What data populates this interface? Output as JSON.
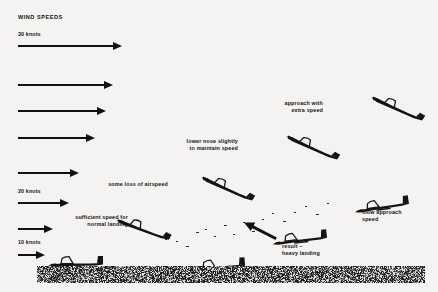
{
  "diagram": {
    "title": "WIND SPEEDS",
    "background_color": "#f4f3f1",
    "ink_color": "#111111",
    "ground_color": "#9a9a96"
  },
  "wind_scale": {
    "labels": [
      {
        "text": "30 knots",
        "x": 18,
        "y": 31
      },
      {
        "text": "20 knots",
        "x": 18,
        "y": 188
      },
      {
        "text": "10 knots",
        "x": 18,
        "y": 239
      }
    ],
    "arrows": [
      {
        "name": "wind-arrow-30-knots",
        "x": 18,
        "y": 45,
        "length": 95,
        "speed_knots": 30
      },
      {
        "name": "wind-arrow-2",
        "x": 18,
        "y": 84,
        "length": 86,
        "speed_knots": 27
      },
      {
        "name": "wind-arrow-3",
        "x": 18,
        "y": 110,
        "length": 79,
        "speed_knots": 25
      },
      {
        "name": "wind-arrow-4",
        "x": 18,
        "y": 137,
        "length": 68,
        "speed_knots": 23
      },
      {
        "name": "wind-arrow-5",
        "x": 18,
        "y": 172,
        "length": 52,
        "speed_knots": 21
      },
      {
        "name": "wind-arrow-20-knots",
        "x": 18,
        "y": 202,
        "length": 42,
        "speed_knots": 20
      },
      {
        "name": "wind-arrow-7",
        "x": 18,
        "y": 228,
        "length": 26,
        "speed_knots": 14
      },
      {
        "name": "wind-arrow-10-knots",
        "x": 18,
        "y": 254,
        "length": 18,
        "speed_knots": 10
      }
    ]
  },
  "annotations": [
    {
      "name": "annotation-approach-with-extra-speed",
      "line1": "approach with",
      "line2": "extra speed",
      "x": 323,
      "y": 100,
      "align": "right"
    },
    {
      "name": "annotation-lower-nose-slightly",
      "line1": "lower nose slightly",
      "line2": "to maintain speed",
      "x": 238,
      "y": 138,
      "align": "right"
    },
    {
      "name": "annotation-some-loss-of-airspeed",
      "line1": "some loss of airspeed",
      "line2": "",
      "x": 168,
      "y": 181,
      "align": "right"
    },
    {
      "name": "annotation-sufficient-speed-for-normal-landing",
      "line1": "sufficient speed for",
      "line2": "normal landing",
      "x": 128,
      "y": 214,
      "align": "right"
    },
    {
      "name": "annotation-slow-approach-speed",
      "line1": "slow approach",
      "line2": "speed",
      "x": 362,
      "y": 209,
      "align": "left"
    },
    {
      "name": "annotation-result-heavy-landing",
      "line1": "result –",
      "line2": "heavy landing",
      "x": 282,
      "y": 243,
      "align": "left"
    }
  ],
  "gliders": [
    {
      "name": "glider-approach-extra-speed",
      "x": 366,
      "y": 98,
      "scale": 1.0,
      "rotation": 34,
      "state": "nose-down-fast"
    },
    {
      "name": "glider-lower-nose",
      "x": 281,
      "y": 137,
      "scale": 1.0,
      "rotation": 34,
      "state": "nose-down-fast"
    },
    {
      "name": "glider-some-loss-airspeed",
      "x": 196,
      "y": 178,
      "scale": 1.0,
      "rotation": 34,
      "state": "nose-down-fast"
    },
    {
      "name": "glider-sufficient-speed",
      "x": 112,
      "y": 219,
      "scale": 1.0,
      "rotation": 30,
      "state": "nose-down-fast"
    },
    {
      "name": "glider-landed-normal",
      "x": 46,
      "y": 253,
      "scale": 1.0,
      "rotation": 0,
      "state": "level-landed"
    },
    {
      "name": "glider-slow-approach",
      "x": 352,
      "y": 196,
      "scale": 1.0,
      "rotation": -8,
      "state": "level-slow"
    },
    {
      "name": "glider-slow-descending",
      "x": 270,
      "y": 229,
      "scale": 1.0,
      "rotation": -6,
      "state": "level-slow"
    },
    {
      "name": "glider-heavy-landing",
      "x": 188,
      "y": 256,
      "scale": 1.0,
      "rotation": -4,
      "state": "heavy-landing"
    }
  ],
  "ground": {
    "x": 37,
    "y": 266,
    "width": 388,
    "height": 17
  },
  "descent_trail_dots": [
    {
      "x": 196,
      "y": 232
    },
    {
      "x": 205,
      "y": 229
    },
    {
      "x": 214,
      "y": 236
    },
    {
      "x": 224,
      "y": 225
    },
    {
      "x": 233,
      "y": 234
    },
    {
      "x": 243,
      "y": 222
    },
    {
      "x": 252,
      "y": 231
    },
    {
      "x": 262,
      "y": 219
    },
    {
      "x": 272,
      "y": 213
    },
    {
      "x": 283,
      "y": 221
    },
    {
      "x": 294,
      "y": 212
    },
    {
      "x": 305,
      "y": 206
    },
    {
      "x": 316,
      "y": 214
    },
    {
      "x": 327,
      "y": 203
    },
    {
      "x": 176,
      "y": 241
    },
    {
      "x": 186,
      "y": 246
    },
    {
      "x": 165,
      "y": 239
    }
  ],
  "pointer_arrow": {
    "name": "result-pointer-arrow",
    "x": 240,
    "y": 233,
    "length": 36,
    "angle": 28
  }
}
